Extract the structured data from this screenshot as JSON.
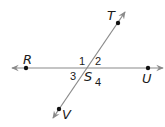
{
  "diagram": {
    "type": "intersecting-lines",
    "colors": {
      "line": "#8a8a8a",
      "point": "#111111",
      "text": "#1a1a1a"
    },
    "lines": [
      {
        "name": "RU",
        "from": [
          12,
          68
        ],
        "to": [
          163,
          68
        ],
        "arrows": "both"
      },
      {
        "name": "TV",
        "from": [
          53,
          118
        ],
        "to": [
          125,
          12
        ],
        "arrows": "both"
      }
    ],
    "points": [
      {
        "label": "R",
        "pos": [
          26,
          68
        ],
        "label_pos": [
          23,
          64
        ]
      },
      {
        "label": "T",
        "pos": [
          118,
          23
        ],
        "label_pos": [
          107,
          20
        ]
      },
      {
        "label": "U",
        "pos": [
          148,
          68
        ],
        "label_pos": [
          142,
          83
        ]
      },
      {
        "label": "V",
        "pos": [
          59,
          109
        ],
        "label_pos": [
          62,
          119
        ]
      }
    ],
    "intersection": {
      "label": "S",
      "pos": [
        87,
        68
      ],
      "label_pos": [
        84,
        81
      ]
    },
    "angles": [
      {
        "label": "1",
        "pos": [
          79,
          65
        ]
      },
      {
        "label": "2",
        "pos": [
          95,
          65
        ]
      },
      {
        "label": "3",
        "pos": [
          70,
          80
        ]
      },
      {
        "label": "4",
        "pos": [
          95,
          86
        ]
      }
    ]
  }
}
